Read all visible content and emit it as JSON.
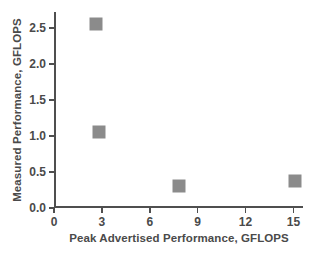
{
  "chart_data": {
    "type": "scatter",
    "title": "",
    "xlabel": "Peak Advertised Performance, GFLOPS",
    "ylabel": "Measured  Performance, GFLOPS",
    "xlim": [
      0,
      15.6
    ],
    "ylim": [
      0.0,
      2.72
    ],
    "xticks": [
      "0",
      "3",
      "6",
      "9",
      "12",
      "15"
    ],
    "xtick_values": [
      0,
      3,
      6,
      9,
      12,
      15
    ],
    "yticks": [
      "0.0",
      "0.5",
      "1.0",
      "1.5",
      "2.0",
      "2.5"
    ],
    "ytick_values": [
      0.0,
      0.5,
      1.0,
      1.5,
      2.0,
      2.5
    ],
    "grid": false,
    "legend": false,
    "marker_shape": "square",
    "marker_color": "#8b8b8b",
    "points": [
      {
        "x": 2.6,
        "y": 2.55
      },
      {
        "x": 2.8,
        "y": 1.05
      },
      {
        "x": 7.8,
        "y": 0.31
      },
      {
        "x": 15.1,
        "y": 0.38
      }
    ]
  }
}
